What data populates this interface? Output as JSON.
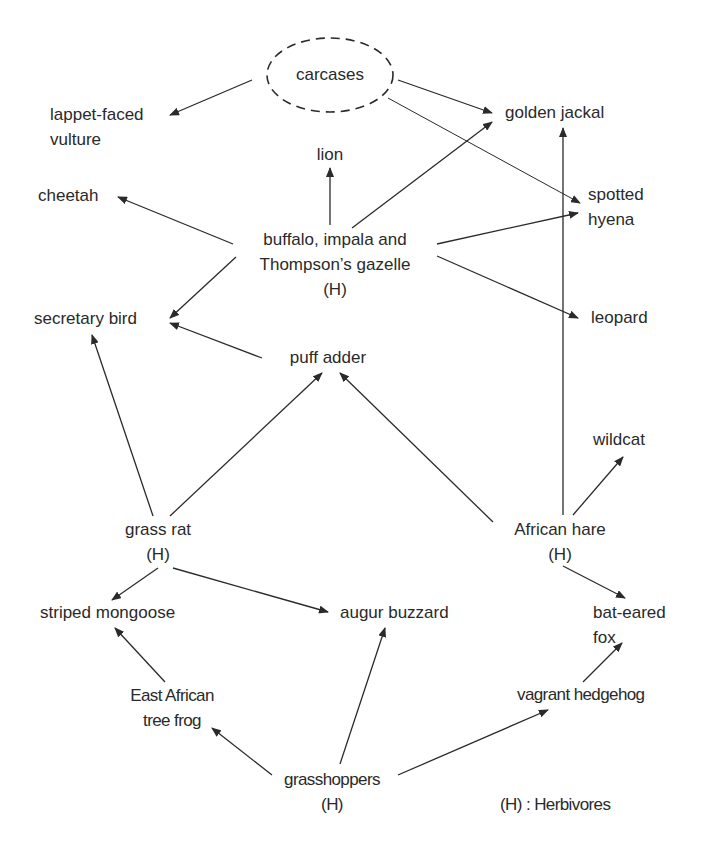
{
  "diagram": {
    "type": "food-web",
    "nodes": {
      "carcases": {
        "label": "carcases",
        "style": "dashed-ellipse"
      },
      "lappet_faced_vulture": {
        "line1": "lappet-faced",
        "line2": "vulture"
      },
      "golden_jackal": {
        "label": "golden jackal"
      },
      "lion": {
        "label": "lion"
      },
      "cheetah": {
        "label": "cheetah"
      },
      "spotted_hyena": {
        "line1": "spotted",
        "line2": "hyena"
      },
      "buffalo_impala_gazelle": {
        "line1": "buffalo, impala and",
        "line2": "Thompson’s gazelle",
        "line3": "(H)"
      },
      "secretary_bird": {
        "label": "secretary bird"
      },
      "leopard": {
        "label": "leopard"
      },
      "puff_adder": {
        "label": "puff adder"
      },
      "wildcat": {
        "label": "wildcat"
      },
      "grass_rat": {
        "line1": "grass rat",
        "line2": "(H)"
      },
      "african_hare": {
        "line1": "African hare",
        "line2": "(H)"
      },
      "striped_mongoose": {
        "label": "striped mongoose"
      },
      "augur_buzzard": {
        "label": "augur buzzard"
      },
      "bat_eared_fox": {
        "line1": "bat-eared",
        "line2": "fox"
      },
      "east_african_tree_frog": {
        "line1": "East African",
        "line2": "tree frog"
      },
      "vagrant_hedgehog": {
        "label": "vagrant hedgehog"
      },
      "grasshoppers": {
        "line1": "grasshoppers",
        "line2": "(H)"
      }
    },
    "edges": [
      {
        "from": "carcases",
        "to": "lappet-faced vulture"
      },
      {
        "from": "carcases",
        "to": "golden jackal"
      },
      {
        "from": "carcases",
        "to": "spotted hyena"
      },
      {
        "from": "buffalo, impala and Thompson’s gazelle",
        "to": "lion"
      },
      {
        "from": "buffalo, impala and Thompson’s gazelle",
        "to": "cheetah"
      },
      {
        "from": "buffalo, impala and Thompson’s gazelle",
        "to": "golden jackal"
      },
      {
        "from": "buffalo, impala and Thompson’s gazelle",
        "to": "spotted hyena"
      },
      {
        "from": "buffalo, impala and Thompson’s gazelle",
        "to": "leopard"
      },
      {
        "from": "buffalo, impala and Thompson’s gazelle",
        "to": "secretary bird"
      },
      {
        "from": "puff adder",
        "to": "secretary bird"
      },
      {
        "from": "grass rat",
        "to": "secretary bird"
      },
      {
        "from": "grass rat",
        "to": "puff adder"
      },
      {
        "from": "grass rat",
        "to": "striped mongoose"
      },
      {
        "from": "grass rat",
        "to": "augur buzzard"
      },
      {
        "from": "African hare",
        "to": "puff adder"
      },
      {
        "from": "African hare",
        "to": "golden jackal"
      },
      {
        "from": "African hare",
        "to": "wildcat"
      },
      {
        "from": "African hare",
        "to": "bat-eared fox"
      },
      {
        "from": "East African tree frog",
        "to": "striped mongoose"
      },
      {
        "from": "grasshoppers",
        "to": "East African tree frog"
      },
      {
        "from": "grasshoppers",
        "to": "augur buzzard"
      },
      {
        "from": "grasshoppers",
        "to": "vagrant hedgehog"
      },
      {
        "from": "vagrant hedgehog",
        "to": "bat-eared fox"
      }
    ],
    "legend": {
      "text": "(H) : Herbivores"
    }
  }
}
